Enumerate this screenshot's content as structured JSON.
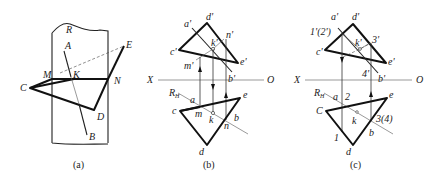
{
  "figure": {
    "panels": [
      {
        "id": "a",
        "caption": "(a)",
        "labels": {
          "R": "R",
          "A": "A",
          "B": "B",
          "C": "C",
          "D": "D",
          "E": "E",
          "M": "M",
          "K": "K",
          "N": "N"
        }
      },
      {
        "id": "b",
        "caption": "(b)",
        "labels": {
          "a_p": "a'",
          "d_p": "d'",
          "k_p": "k'",
          "n_p": "n'",
          "c_p": "c'",
          "m_p": "m'",
          "e_p": "e'",
          "b_p": "b'",
          "X": "X",
          "O": "O",
          "RH": "R",
          "RH_sub": "H",
          "a": "a",
          "c": "c",
          "m": "m",
          "k": "k",
          "e": "e",
          "b": "b",
          "n": "n",
          "d": "d"
        }
      },
      {
        "id": "c",
        "caption": "(c)",
        "labels": {
          "a_p": "a'",
          "d_p": "d'",
          "one_two_p": "1'(2')",
          "k_p": "k'",
          "three_p": "3'",
          "c_p": "c'",
          "e_p": "e'",
          "four_p": "4'",
          "b_p": "b'",
          "X": "X",
          "O": "O",
          "RH": "R",
          "RH_sub": "H",
          "a": "a",
          "two": "2",
          "C": "C",
          "e": "e",
          "k": "k",
          "three_four": "3(4)",
          "one": "1",
          "b": "b",
          "d": "d"
        }
      }
    ]
  }
}
